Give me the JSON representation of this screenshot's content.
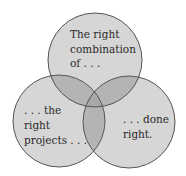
{
  "diagram": {
    "type": "venn",
    "colors": {
      "circle_fill": "#d6d6d6",
      "pair_overlap_fill": "#b4b4b4",
      "center_overlap_fill": "#a8a8a8",
      "stroke": "#555555",
      "text": "#2a2a2a"
    },
    "circles": [
      {
        "id": "top",
        "lines": [
          "The right",
          "combination",
          "of . . ."
        ]
      },
      {
        "id": "left",
        "lines": [
          ". . . the",
          "right",
          "projects . . ."
        ]
      },
      {
        "id": "right",
        "lines": [
          ". . . done",
          "right."
        ]
      }
    ]
  }
}
